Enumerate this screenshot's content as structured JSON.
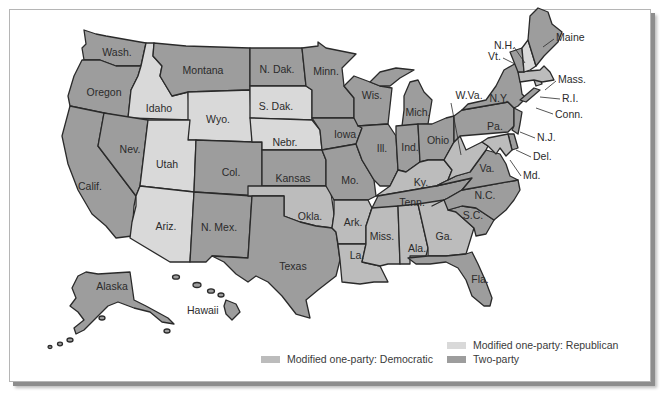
{
  "colors": {
    "republican": "#d9d9d9",
    "democratic": "#bcbcbc",
    "two_party": "#9d9d9d",
    "border": "#2a2a2a"
  },
  "legend": {
    "republican": "Modified one-party: Republican",
    "democratic": "Modified one-party: Democratic",
    "two_party": "Two-party"
  },
  "states": {
    "wash": "Wash.",
    "oregon": "Oregon",
    "calif": "Calif.",
    "idaho": "Idaho",
    "nev": "Nev.",
    "montana": "Montana",
    "wyo": "Wyo.",
    "utah": "Utah",
    "ariz": "Ariz.",
    "col": "Col.",
    "nmex": "N. Mex.",
    "ndak": "N. Dak.",
    "sdak": "S. Dak.",
    "nebr": "Nebr.",
    "kansas": "Kansas",
    "okla": "Okla.",
    "texas": "Texas",
    "minn": "Minn.",
    "iowa": "Iowa",
    "mo": "Mo.",
    "ark": "Ark.",
    "la": "La.",
    "wis": "Wis.",
    "ill": "Ill.",
    "mich": "Mich.",
    "ind": "Ind.",
    "ohio": "Ohio",
    "ky": "Ky.",
    "tenn": "Tenn.",
    "miss": "Miss.",
    "ala": "Ala.",
    "ga": "Ga.",
    "fla": "Fla.",
    "sc": "S.C.",
    "nc": "N.C.",
    "va": "Va.",
    "wva": "W.Va.",
    "pa": "Pa.",
    "ny": "N.Y.",
    "nj": "N.J.",
    "del": "Del.",
    "md": "Md.",
    "conn": "Conn.",
    "ri": "R.I.",
    "mass": "Mass.",
    "vt": "Vt.",
    "nh": "N.H.",
    "maine": "Maine",
    "alaska": "Alaska",
    "hawaii": "Hawaii"
  },
  "classification": {
    "republican": [
      "Idaho",
      "Wyo.",
      "Utah",
      "Ariz.",
      "S. Dak.",
      "Nebr.",
      "N.H."
    ],
    "democratic": [
      "Okla.",
      "Ark.",
      "La.",
      "Miss.",
      "Ala.",
      "Ga.",
      "Ky.",
      "W.Va.",
      "Md.",
      "Mass.",
      "R.I."
    ],
    "two_party": [
      "Wash.",
      "Oregon",
      "Calif.",
      "Nev.",
      "Montana",
      "Col.",
      "N. Mex.",
      "N. Dak.",
      "Kansas",
      "Texas",
      "Minn.",
      "Iowa",
      "Mo.",
      "Wis.",
      "Ill.",
      "Mich.",
      "Ind.",
      "Ohio",
      "Tenn.",
      "Fla.",
      "S.C.",
      "N.C.",
      "Va.",
      "Pa.",
      "N.Y.",
      "N.J.",
      "Del.",
      "Conn.",
      "Vt.",
      "Maine",
      "Alaska",
      "Hawaii"
    ]
  }
}
